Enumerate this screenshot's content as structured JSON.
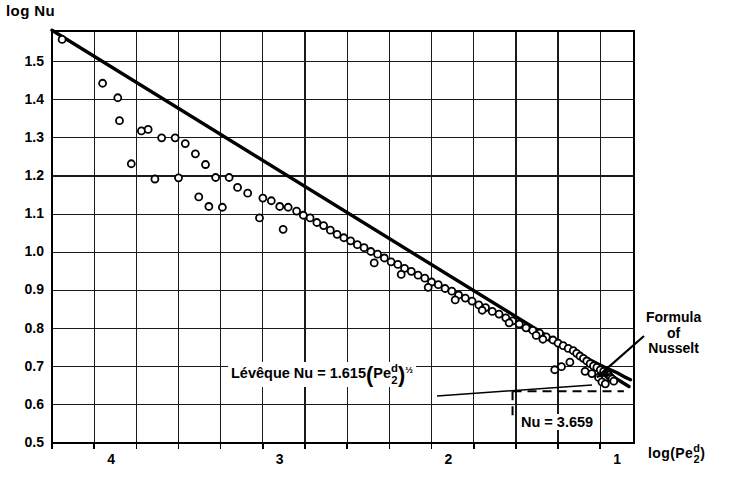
{
  "chart_data": {
    "type": "scatter",
    "title": "",
    "xlabel": "log(Pe d/2)",
    "ylabel": "log Nu",
    "xlabel_parts": {
      "prefix": "log(",
      "base": "Pe",
      "num": "d",
      "den": "2",
      "suffix": ")"
    },
    "xlim": [
      4.35,
      0.9
    ],
    "ylim": [
      0.5,
      1.58
    ],
    "x_reversed": true,
    "grid": true,
    "xticks": [
      4,
      3,
      2,
      1
    ],
    "xtick_labels": [
      "4",
      "3",
      "2",
      "1"
    ],
    "x_minor_step": 0.25,
    "yticks": [
      0.5,
      0.6,
      0.7,
      0.8,
      0.9,
      1.0,
      1.1,
      1.2,
      1.3,
      1.4,
      1.5
    ],
    "ytick_labels": [
      "0.5",
      "0.6",
      "0.7",
      "0.8",
      "0.9",
      "1.0",
      "1.1",
      "1.2",
      "1.3",
      "1.4",
      "1.5"
    ],
    "legend_position": "none",
    "series": [
      {
        "name": "measurements",
        "type": "scatter",
        "marker": "open-circle",
        "points": [
          [
            4.29,
            1.558
          ],
          [
            4.05,
            1.443
          ],
          [
            3.96,
            1.405
          ],
          [
            3.95,
            1.345
          ],
          [
            3.82,
            1.318
          ],
          [
            3.78,
            1.322
          ],
          [
            3.7,
            1.3
          ],
          [
            3.62,
            1.3
          ],
          [
            3.56,
            1.285
          ],
          [
            3.5,
            1.258
          ],
          [
            3.44,
            1.23
          ],
          [
            3.38,
            1.196
          ],
          [
            3.3,
            1.196
          ],
          [
            3.25,
            1.17
          ],
          [
            3.19,
            1.155
          ],
          [
            3.1,
            1.142
          ],
          [
            3.05,
            1.135
          ],
          [
            3.0,
            1.12
          ],
          [
            2.95,
            1.118
          ],
          [
            2.9,
            1.108
          ],
          [
            2.86,
            1.097
          ],
          [
            2.82,
            1.09
          ],
          [
            2.78,
            1.078
          ],
          [
            2.74,
            1.07
          ],
          [
            2.7,
            1.058
          ],
          [
            2.66,
            1.047
          ],
          [
            2.62,
            1.038
          ],
          [
            2.58,
            1.03
          ],
          [
            2.54,
            1.02
          ],
          [
            2.5,
            1.012
          ],
          [
            2.46,
            1.002
          ],
          [
            2.42,
            0.995
          ],
          [
            2.38,
            0.985
          ],
          [
            2.34,
            0.975
          ],
          [
            2.3,
            0.968
          ],
          [
            2.26,
            0.958
          ],
          [
            2.22,
            0.95
          ],
          [
            2.18,
            0.94
          ],
          [
            2.14,
            0.932
          ],
          [
            2.1,
            0.922
          ],
          [
            2.06,
            0.915
          ],
          [
            2.02,
            0.905
          ],
          [
            1.98,
            0.898
          ],
          [
            1.94,
            0.888
          ],
          [
            1.9,
            0.88
          ],
          [
            1.86,
            0.872
          ],
          [
            1.82,
            0.862
          ],
          [
            1.78,
            0.855
          ],
          [
            1.74,
            0.845
          ],
          [
            1.7,
            0.838
          ],
          [
            1.66,
            0.828
          ],
          [
            1.62,
            0.82
          ],
          [
            1.58,
            0.812
          ],
          [
            1.54,
            0.802
          ],
          [
            1.5,
            0.795
          ],
          [
            1.46,
            0.788
          ],
          [
            1.42,
            0.778
          ],
          [
            1.38,
            0.77
          ],
          [
            1.35,
            0.762
          ],
          [
            1.32,
            0.755
          ],
          [
            1.29,
            0.748
          ],
          [
            1.26,
            0.742
          ],
          [
            1.24,
            0.735
          ],
          [
            1.22,
            0.728
          ],
          [
            1.2,
            0.722
          ],
          [
            1.18,
            0.715
          ],
          [
            1.16,
            0.708
          ],
          [
            1.14,
            0.702
          ],
          [
            1.12,
            0.698
          ],
          [
            1.1,
            0.692
          ],
          [
            1.08,
            0.688
          ],
          [
            1.06,
            0.682
          ],
          [
            1.05,
            0.678
          ],
          [
            1.04,
            0.672
          ],
          [
            1.03,
            0.668
          ],
          [
            1.02,
            0.662
          ],
          [
            3.88,
            1.232
          ],
          [
            3.74,
            1.192
          ],
          [
            3.6,
            1.195
          ],
          [
            3.48,
            1.145
          ],
          [
            3.42,
            1.12
          ],
          [
            3.34,
            1.118
          ],
          [
            3.12,
            1.09
          ],
          [
            2.98,
            1.06
          ],
          [
            1.28,
            0.712
          ],
          [
            1.33,
            0.7
          ],
          [
            1.37,
            0.692
          ],
          [
            1.19,
            0.688
          ],
          [
            1.15,
            0.682
          ],
          [
            1.11,
            0.672
          ],
          [
            1.09,
            0.66
          ],
          [
            1.07,
            0.655
          ],
          [
            2.44,
            0.972
          ],
          [
            2.28,
            0.942
          ],
          [
            2.12,
            0.908
          ],
          [
            1.96,
            0.875
          ],
          [
            1.8,
            0.848
          ],
          [
            1.64,
            0.815
          ],
          [
            1.48,
            0.782
          ],
          [
            1.44,
            0.772
          ]
        ]
      },
      {
        "name": "Leveque line",
        "type": "line",
        "style": "solid-thick",
        "endpoints": [
          [
            4.35,
            1.582
          ],
          [
            0.93,
            0.648
          ]
        ]
      },
      {
        "name": "Nusselt curve",
        "type": "line",
        "style": "solid-thick",
        "path": [
          [
            1.62,
            0.818
          ],
          [
            1.45,
            0.78
          ],
          [
            1.3,
            0.748
          ],
          [
            1.18,
            0.722
          ],
          [
            1.08,
            0.7
          ],
          [
            1.0,
            0.684
          ],
          [
            0.95,
            0.672
          ],
          [
            0.92,
            0.666
          ]
        ]
      },
      {
        "name": "Nu asymptote",
        "type": "line",
        "style": "dashed",
        "value": 3.659
      }
    ],
    "annotations": [
      {
        "name": "leveque-formula",
        "text": "Lévêque Nu = 1.615 (Pe d/2)^1/3",
        "prefix": "Lévêque Nu = 1.615",
        "base": "Pe",
        "num": "d",
        "den": "2",
        "exponent": "⅓"
      },
      {
        "name": "formula-of-nusselt",
        "line1": "Formula",
        "line2": "of",
        "line3": "Nusselt"
      },
      {
        "name": "nu-asymptote-label",
        "text": "Nu = 3.659",
        "value": 3.659
      }
    ]
  },
  "colors": {
    "ink": "#000000",
    "grid": "#1a1a1a",
    "background": "#ffffff"
  }
}
